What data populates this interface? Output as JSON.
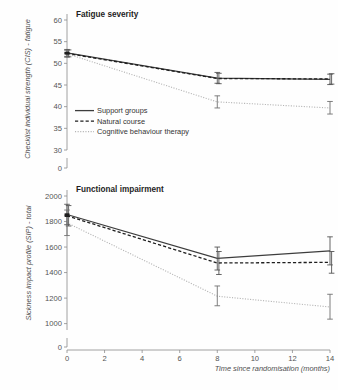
{
  "figure": {
    "background_color": "#fefefe",
    "axis_color": "#8c8c8c"
  },
  "legend": {
    "items": [
      {
        "label": "Support groups",
        "style": "solid",
        "color": "#3d3d3d"
      },
      {
        "label": "Natural course",
        "style": "dashed",
        "color": "#1e1e1e"
      },
      {
        "label": "Cognitive behaviour therapy",
        "style": "dotted",
        "color": "#b4b4b4"
      }
    ]
  },
  "xaxis": {
    "label": "Time since randomisation (months)",
    "ticks": [
      0,
      2,
      4,
      6,
      8,
      10,
      12,
      14
    ],
    "tick_labels": [
      "0",
      "2",
      "4",
      "6",
      "8",
      "10",
      "12",
      "14"
    ],
    "min": 0,
    "max": 14
  },
  "chart_data": [
    {
      "type": "line",
      "title": "Fatigue severity",
      "xlabel": "Time since randomisation (months)",
      "ylabel": "Checklist individual strength (CIS) - fatigue",
      "x": [
        0,
        8,
        14
      ],
      "ylim": [
        30,
        60
      ],
      "yticks": [
        30,
        35,
        40,
        45,
        50,
        55,
        60
      ],
      "ytick_labels": [
        "30",
        "35",
        "40",
        "45",
        "50",
        "55",
        "60"
      ],
      "axis_break_label": "0",
      "grid": false,
      "legend_position": "inside-lower-left",
      "series": [
        {
          "name": "Support groups",
          "style": "solid",
          "values": [
            52.4,
            46.6,
            46.3
          ],
          "err_low": [
            51.6,
            45.4,
            45.1
          ],
          "err_high": [
            53.2,
            47.9,
            47.5
          ]
        },
        {
          "name": "Natural course",
          "style": "dashed",
          "values": [
            52.3,
            46.5,
            46.4
          ],
          "err_low": [
            51.5,
            45.3,
            45.2
          ],
          "err_high": [
            53.1,
            47.7,
            47.6
          ]
        },
        {
          "name": "Cognitive behaviour therapy",
          "style": "dotted",
          "values": [
            52.2,
            41.1,
            39.7
          ],
          "err_low": [
            51.4,
            39.7,
            38.3
          ],
          "err_high": [
            53.0,
            42.5,
            41.2
          ]
        }
      ]
    },
    {
      "type": "line",
      "title": "Functional impairment",
      "xlabel": "Time since randomisation (months)",
      "ylabel": "Sickness impact profile (SIP) - total",
      "x": [
        0,
        8,
        14
      ],
      "ylim": [
        950,
        2000
      ],
      "yticks": [
        1000,
        1200,
        1400,
        1600,
        1800,
        2000
      ],
      "ytick_labels": [
        "1000",
        "1200",
        "1400",
        "1600",
        "1800",
        "2000"
      ],
      "axis_break_label": "0",
      "grid": false,
      "legend_position": "none",
      "series": [
        {
          "name": "Support groups",
          "style": "solid",
          "values": [
            1855,
            1512,
            1570
          ],
          "err_low": [
            1775,
            1420,
            1460
          ],
          "err_high": [
            1935,
            1600,
            1680
          ]
        },
        {
          "name": "Natural course",
          "style": "dashed",
          "values": [
            1845,
            1475,
            1480
          ],
          "err_low": [
            1765,
            1385,
            1395
          ],
          "err_high": [
            1925,
            1565,
            1565
          ]
        },
        {
          "name": "Cognitive behaviour therapy",
          "style": "dotted",
          "values": [
            1790,
            1215,
            1130
          ],
          "err_low": [
            1690,
            1140,
            1035
          ],
          "err_high": [
            1890,
            1295,
            1230
          ]
        }
      ]
    }
  ]
}
